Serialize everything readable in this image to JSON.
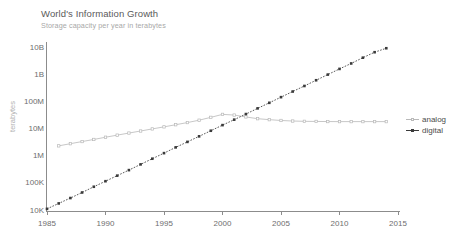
{
  "chart_data": {
    "type": "line",
    "title": "World's Information Growth",
    "subtitle": "Storage capacity per year in terabytes",
    "xlabel": "",
    "ylabel": "terabytes",
    "yscale": "log",
    "ylim": [
      10000,
      10000000000
    ],
    "xlim": [
      1985,
      2015
    ],
    "grid": false,
    "legend_position": "right",
    "ytick_labels": [
      "10B",
      "1B",
      "100M",
      "10M",
      "1M",
      "100K",
      "10K"
    ],
    "ytick_values": [
      10000000000,
      1000000000,
      100000000,
      10000000,
      1000000,
      100000,
      10000
    ],
    "xtick_labels": [
      "1985",
      "1990",
      "1995",
      "2000",
      "2005",
      "2010",
      "2015"
    ],
    "xtick_values": [
      1985,
      1990,
      1995,
      2000,
      2005,
      2010,
      2015
    ],
    "series": [
      {
        "name": "analog",
        "color": "#b9b9b9",
        "marker": "square-open",
        "x": [
          1986,
          1987,
          1988,
          1989,
          1990,
          1991,
          1992,
          1993,
          1994,
          1995,
          1996,
          1997,
          1998,
          1999,
          2000,
          2001,
          2002,
          2003,
          2004,
          2005,
          2006,
          2007,
          2008,
          2009,
          2010,
          2011,
          2012,
          2013,
          2014
        ],
        "values": [
          2500000,
          3000000,
          3600000,
          4300000,
          5200000,
          6200000,
          7400000,
          8800000,
          10500000,
          12500000,
          15000000,
          18000000,
          22000000,
          28000000,
          36000000,
          34000000,
          29000000,
          25000000,
          23000000,
          21500000,
          20500000,
          20000000,
          19800000,
          19600000,
          19500000,
          19500000,
          19500000,
          19500000,
          19500000
        ]
      },
      {
        "name": "digital",
        "color": "#3a3a3a",
        "marker": "square-filled",
        "x": [
          1985,
          1986,
          1987,
          1988,
          1989,
          1990,
          1991,
          1992,
          1993,
          1994,
          1995,
          1996,
          1997,
          1998,
          1999,
          2000,
          2001,
          2002,
          2003,
          2004,
          2005,
          2006,
          2007,
          2008,
          2009,
          2010,
          2011,
          2012,
          2013,
          2014
        ],
        "values": [
          12000,
          19000,
          30000,
          48000,
          78000,
          125000,
          200000,
          320000,
          520000,
          840000,
          1350000,
          2200000,
          3500000,
          5600000,
          9000000,
          14500000,
          23000000,
          37000000,
          60000000,
          96000000,
          155000000,
          250000000,
          400000000,
          650000000,
          1050000000,
          1700000000,
          2700000000,
          4400000000,
          7000000000,
          9800000000
        ]
      }
    ]
  },
  "legend": {
    "items": [
      {
        "label": "analog"
      },
      {
        "label": "digital"
      }
    ]
  },
  "colors": {
    "analog": "#b9b9b9",
    "digital": "#3a3a3a",
    "axis": "#8c8c8c",
    "title": "#5a5a5a",
    "subtitle": "#a8a8a8",
    "tick": "#6e6e6e"
  }
}
